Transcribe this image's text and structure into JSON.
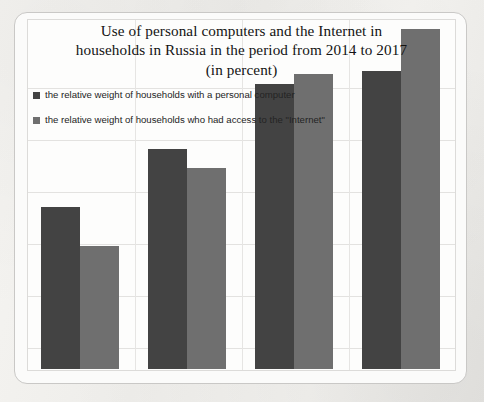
{
  "chart_data": {
    "type": "bar",
    "title": "Use of personal computers and the Internet in households in Russia in the period from 2014 to 2017 (in percent)",
    "title_lines": [
      "Use of personal computers and the Internet in",
      "households in Russia in the period from 2014 to 2017",
      "(in percent)"
    ],
    "categories": [
      "2014",
      "2015",
      "2016",
      "2017"
    ],
    "series": [
      {
        "name": "the relative weight of households with a personal computer",
        "color": "#434343",
        "values": [
          50,
          68,
          88,
          92
        ]
      },
      {
        "name": "the relative weight of households who had access to the \"Internet\"",
        "color": "#6f6f6f",
        "values": [
          38,
          62,
          91,
          105
        ]
      }
    ],
    "xlabel": "",
    "ylabel": "",
    "ylim": [
      0,
      108
    ],
    "grid": true,
    "grid_horizontal_values": [
      18,
      36,
      54,
      72,
      90,
      108
    ],
    "legend_position": "top-left",
    "axis_tick_labels_visible": false
  },
  "legend": {
    "items": [
      {
        "label": "the relative weight of households with a personal computer",
        "swatch_color": "#434343",
        "icon": "square-marker-icon"
      },
      {
        "label": "the relative weight of households who had access to the \"Internet\"",
        "swatch_color": "#6f6f6f",
        "icon": "square-marker-icon"
      }
    ]
  },
  "ghost_text": {
    "left_margin": "",
    "bottom_margin": ""
  }
}
